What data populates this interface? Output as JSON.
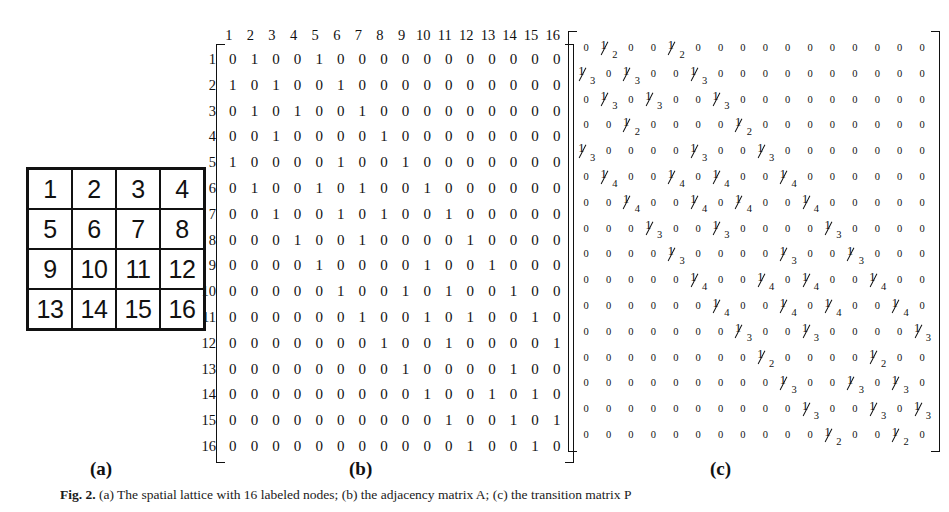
{
  "figure": {
    "caption_prefix": "Fig. 2.",
    "caption_text": "(a) The spatial lattice with 16 labeled nodes; (b) the adjacency matrix A; (c) the transition matrix P",
    "panels": [
      {
        "key": "a",
        "label": "(a)",
        "title": "4x4 labeled grid"
      },
      {
        "key": "b",
        "label": "(b)",
        "title": "adjacency matrix"
      },
      {
        "key": "c",
        "label": "(c)",
        "title": "transition probability matrix"
      }
    ]
  },
  "panel_a": {
    "rows": [
      [
        "1",
        "2",
        "3",
        "4"
      ],
      [
        "5",
        "6",
        "7",
        "8"
      ],
      [
        "9",
        "10",
        "11",
        "12"
      ],
      [
        "13",
        "14",
        "15",
        "16"
      ]
    ]
  },
  "panel_b": {
    "col_headers": [
      "1",
      "2",
      "3",
      "4",
      "5",
      "6",
      "7",
      "8",
      "9",
      "10",
      "11",
      "12",
      "13",
      "14",
      "15",
      "16"
    ],
    "row_headers": [
      "1",
      "2",
      "3",
      "4",
      "5",
      "6",
      "7",
      "8",
      "9",
      "10",
      "11",
      "12",
      "13",
      "14",
      "15",
      "16"
    ],
    "matrix": [
      [
        "0",
        "1",
        "0",
        "0",
        "1",
        "0",
        "0",
        "0",
        "0",
        "0",
        "0",
        "0",
        "0",
        "0",
        "0",
        "0"
      ],
      [
        "1",
        "0",
        "1",
        "0",
        "0",
        "1",
        "0",
        "0",
        "0",
        "0",
        "0",
        "0",
        "0",
        "0",
        "0",
        "0"
      ],
      [
        "0",
        "1",
        "0",
        "1",
        "0",
        "0",
        "1",
        "0",
        "0",
        "0",
        "0",
        "0",
        "0",
        "0",
        "0",
        "0"
      ],
      [
        "0",
        "0",
        "1",
        "0",
        "0",
        "0",
        "0",
        "1",
        "0",
        "0",
        "0",
        "0",
        "0",
        "0",
        "0",
        "0"
      ],
      [
        "1",
        "0",
        "0",
        "0",
        "0",
        "1",
        "0",
        "0",
        "1",
        "0",
        "0",
        "0",
        "0",
        "0",
        "0",
        "0"
      ],
      [
        "0",
        "1",
        "0",
        "0",
        "1",
        "0",
        "1",
        "0",
        "0",
        "1",
        "0",
        "0",
        "0",
        "0",
        "0",
        "0"
      ],
      [
        "0",
        "0",
        "1",
        "0",
        "0",
        "1",
        "0",
        "1",
        "0",
        "0",
        "1",
        "0",
        "0",
        "0",
        "0",
        "0"
      ],
      [
        "0",
        "0",
        "0",
        "1",
        "0",
        "0",
        "1",
        "0",
        "0",
        "0",
        "0",
        "1",
        "0",
        "0",
        "0",
        "0"
      ],
      [
        "0",
        "0",
        "0",
        "0",
        "1",
        "0",
        "0",
        "0",
        "0",
        "1",
        "0",
        "0",
        "1",
        "0",
        "0",
        "0"
      ],
      [
        "0",
        "0",
        "0",
        "0",
        "0",
        "1",
        "0",
        "0",
        "1",
        "0",
        "1",
        "0",
        "0",
        "1",
        "0",
        "0"
      ],
      [
        "0",
        "0",
        "0",
        "0",
        "0",
        "0",
        "1",
        "0",
        "0",
        "1",
        "0",
        "1",
        "0",
        "0",
        "1",
        "0"
      ],
      [
        "0",
        "0",
        "0",
        "0",
        "0",
        "0",
        "0",
        "1",
        "0",
        "0",
        "1",
        "0",
        "0",
        "0",
        "0",
        "1"
      ],
      [
        "0",
        "0",
        "0",
        "0",
        "0",
        "0",
        "0",
        "0",
        "1",
        "0",
        "0",
        "0",
        "0",
        "1",
        "0",
        "0"
      ],
      [
        "0",
        "0",
        "0",
        "0",
        "0",
        "0",
        "0",
        "0",
        "0",
        "1",
        "0",
        "0",
        "1",
        "0",
        "1",
        "0"
      ],
      [
        "0",
        "0",
        "0",
        "0",
        "0",
        "0",
        "0",
        "0",
        "0",
        "0",
        "1",
        "0",
        "0",
        "1",
        "0",
        "1"
      ],
      [
        "0",
        "0",
        "0",
        "0",
        "0",
        "0",
        "0",
        "0",
        "0",
        "0",
        "0",
        "1",
        "0",
        "0",
        "1",
        "0"
      ]
    ]
  },
  "panel_c": {
    "matrix": [
      [
        "0",
        "1/2",
        "0",
        "0",
        "1/2",
        "0",
        "0",
        "0",
        "0",
        "0",
        "0",
        "0",
        "0",
        "0",
        "0",
        "0"
      ],
      [
        "1/3",
        "0",
        "1/3",
        "0",
        "0",
        "1/3",
        "0",
        "0",
        "0",
        "0",
        "0",
        "0",
        "0",
        "0",
        "0",
        "0"
      ],
      [
        "0",
        "1/3",
        "0",
        "1/3",
        "0",
        "0",
        "1/3",
        "0",
        "0",
        "0",
        "0",
        "0",
        "0",
        "0",
        "0",
        "0"
      ],
      [
        "0",
        "0",
        "1/2",
        "0",
        "0",
        "0",
        "0",
        "1/2",
        "0",
        "0",
        "0",
        "0",
        "0",
        "0",
        "0",
        "0"
      ],
      [
        "1/3",
        "0",
        "0",
        "0",
        "0",
        "1/3",
        "0",
        "0",
        "1/3",
        "0",
        "0",
        "0",
        "0",
        "0",
        "0",
        "0"
      ],
      [
        "0",
        "1/4",
        "0",
        "0",
        "1/4",
        "0",
        "1/4",
        "0",
        "0",
        "1/4",
        "0",
        "0",
        "0",
        "0",
        "0",
        "0"
      ],
      [
        "0",
        "0",
        "1/4",
        "0",
        "0",
        "1/4",
        "0",
        "1/4",
        "0",
        "0",
        "1/4",
        "0",
        "0",
        "0",
        "0",
        "0"
      ],
      [
        "0",
        "0",
        "0",
        "1/3",
        "0",
        "0",
        "1/3",
        "0",
        "0",
        "0",
        "0",
        "1/3",
        "0",
        "0",
        "0",
        "0"
      ],
      [
        "0",
        "0",
        "0",
        "0",
        "1/3",
        "0",
        "0",
        "0",
        "0",
        "1/3",
        "0",
        "0",
        "1/3",
        "0",
        "0",
        "0"
      ],
      [
        "0",
        "0",
        "0",
        "0",
        "0",
        "1/4",
        "0",
        "0",
        "1/4",
        "0",
        "1/4",
        "0",
        "0",
        "1/4",
        "0",
        "0"
      ],
      [
        "0",
        "0",
        "0",
        "0",
        "0",
        "0",
        "1/4",
        "0",
        "0",
        "1/4",
        "0",
        "1/4",
        "0",
        "0",
        "1/4",
        "0"
      ],
      [
        "0",
        "0",
        "0",
        "0",
        "0",
        "0",
        "0",
        "1/3",
        "0",
        "0",
        "1/3",
        "0",
        "0",
        "0",
        "0",
        "1/3"
      ],
      [
        "0",
        "0",
        "0",
        "0",
        "0",
        "0",
        "0",
        "0",
        "1/2",
        "0",
        "0",
        "0",
        "0",
        "1/2",
        "0",
        "0"
      ],
      [
        "0",
        "0",
        "0",
        "0",
        "0",
        "0",
        "0",
        "0",
        "0",
        "1/3",
        "0",
        "0",
        "1/3",
        "0",
        "1/3",
        "0"
      ],
      [
        "0",
        "0",
        "0",
        "0",
        "0",
        "0",
        "0",
        "0",
        "0",
        "0",
        "1/3",
        "0",
        "0",
        "1/3",
        "0",
        "1/3"
      ],
      [
        "0",
        "0",
        "0",
        "0",
        "0",
        "0",
        "0",
        "0",
        "0",
        "0",
        "0",
        "1/2",
        "0",
        "0",
        "1/2",
        "0"
      ]
    ]
  },
  "colors": {
    "ink": "#111111",
    "page": "#ffffff"
  }
}
